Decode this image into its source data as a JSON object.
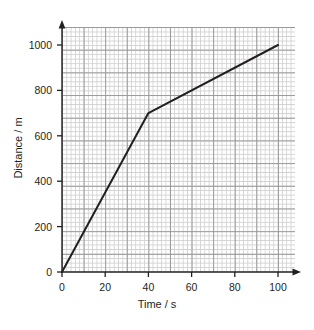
{
  "chart_data": {
    "type": "line",
    "title": "",
    "xlabel": "Time / s",
    "ylabel": "Distance / m",
    "xlim": [
      0,
      100
    ],
    "ylim": [
      0,
      1000
    ],
    "xticks": [
      0,
      20,
      40,
      60,
      80,
      100
    ],
    "yticks": [
      0,
      200,
      400,
      600,
      800,
      1000
    ],
    "xtick_labels": [
      "0",
      "20",
      "40",
      "60",
      "80",
      "100"
    ],
    "ytick_labels": [
      "0",
      "200",
      "400",
      "600",
      "800",
      "1000"
    ],
    "grid": true,
    "grid_minor_x": 2,
    "grid_minor_y": 20,
    "grid_major_x": 10,
    "grid_major_y": 100,
    "legend": null,
    "series": [
      {
        "name": "distance-time",
        "x": [
          0,
          40,
          100
        ],
        "values": [
          0,
          700,
          1000
        ],
        "color": "#231f20",
        "line_width": 2,
        "markers": false
      }
    ],
    "annotations": []
  },
  "axis_style": {
    "arrow_x": true,
    "arrow_y": true,
    "axis_color": "#231f20",
    "grid_major_color": "#9a9a9a",
    "grid_minor_color": "#d2d2d2"
  }
}
